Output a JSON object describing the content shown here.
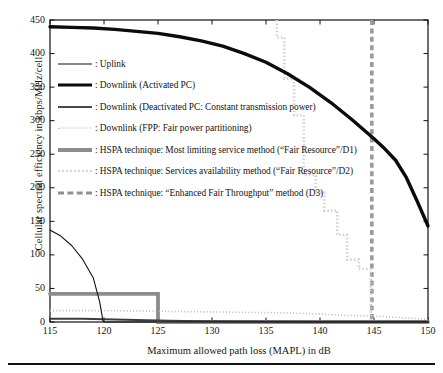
{
  "chart_data": {
    "type": "line",
    "title": "",
    "xlabel": "Maximum allowed path loss (MAPL) in dB",
    "ylabel": "Cellular spectral efficiency in kbps/MHz/cell",
    "xlim": [
      115,
      150
    ],
    "ylim": [
      0,
      450
    ],
    "xticks": [
      115,
      120,
      125,
      130,
      135,
      140,
      145,
      150
    ],
    "yticks": [
      0,
      50,
      100,
      150,
      200,
      250,
      300,
      350,
      400,
      450
    ],
    "grid": false,
    "legend_position": "upper-left-inside",
    "series": [
      {
        "name": "Uplink",
        "style": "thin-solid-black",
        "color": "#111111",
        "points": [
          [
            115,
            137
          ],
          [
            116,
            128
          ],
          [
            117,
            114
          ],
          [
            118,
            94
          ],
          [
            119,
            66
          ],
          [
            119.6,
            30
          ],
          [
            119.9,
            2
          ],
          [
            120,
            0
          ],
          [
            150,
            0
          ]
        ]
      },
      {
        "name": "Downlink (Activated PC)",
        "style": "thick-solid-black",
        "color": "#0b0b0b",
        "points": [
          [
            115,
            440
          ],
          [
            117,
            439
          ],
          [
            119,
            438
          ],
          [
            121,
            436
          ],
          [
            123,
            433
          ],
          [
            125,
            430
          ],
          [
            127,
            425
          ],
          [
            129,
            419
          ],
          [
            131,
            411
          ],
          [
            133,
            400
          ],
          [
            135,
            387
          ],
          [
            137,
            370
          ],
          [
            139,
            350
          ],
          [
            141,
            327
          ],
          [
            143,
            301
          ],
          [
            145,
            273
          ],
          [
            146,
            258
          ],
          [
            147,
            241
          ],
          [
            148,
            215
          ],
          [
            149,
            180
          ],
          [
            150,
            143
          ]
        ]
      },
      {
        "name": "Downlink (Deactivated PC: Constant transmission power)",
        "style": "medium-solid-gray",
        "color": "#3d3d3d",
        "points": [
          [
            115,
            5
          ],
          [
            118,
            5
          ],
          [
            120,
            4
          ],
          [
            123,
            3
          ],
          [
            126,
            2
          ],
          [
            129,
            1
          ],
          [
            133,
            0.6
          ],
          [
            140,
            0.3
          ],
          [
            150,
            0.2
          ]
        ]
      },
      {
        "name": "Downlink (FPP: Fair power partitioning)",
        "style": "dotted-light",
        "color": "#b9b9b9",
        "points": [
          [
            115,
            17
          ],
          [
            120,
            17
          ],
          [
            125,
            16
          ],
          [
            130,
            15
          ],
          [
            135,
            14
          ],
          [
            138,
            13
          ],
          [
            140,
            12
          ],
          [
            142,
            10
          ],
          [
            145,
            9
          ],
          [
            147,
            7
          ],
          [
            149,
            5
          ],
          [
            150,
            4
          ]
        ]
      },
      {
        "name": "HSPA technique: Most limiting service method (\"Fair Resource\"/D1)",
        "style": "thick-gray-step",
        "color": "#8c8c8c",
        "points": [
          [
            115,
            42
          ],
          [
            125,
            42
          ],
          [
            125,
            0
          ],
          [
            150,
            0
          ]
        ]
      },
      {
        "name": "HSPA technique: Services availability method (\"Fair Resource\"/D2)",
        "style": "dotted-staircase-light",
        "color": "#cfcfcf",
        "points": [
          [
            136,
            450
          ],
          [
            136,
            424
          ],
          [
            136.7,
            424
          ],
          [
            136.7,
            363
          ],
          [
            137.6,
            363
          ],
          [
            137.6,
            308
          ],
          [
            138.5,
            308
          ],
          [
            138.5,
            219
          ],
          [
            139.6,
            219
          ],
          [
            139.6,
            193
          ],
          [
            140.4,
            193
          ],
          [
            140.4,
            166
          ],
          [
            141.6,
            166
          ],
          [
            141.6,
            130
          ],
          [
            142.5,
            130
          ],
          [
            142.5,
            93
          ],
          [
            143.6,
            93
          ],
          [
            143.6,
            79
          ],
          [
            144.7,
            79
          ],
          [
            144.7,
            0
          ]
        ]
      },
      {
        "name": "HSPA technique: \"Enhanced Fair Throughput\" method (D3)",
        "style": "thick-dashed-gray-vertical",
        "color": "#9a9a9a",
        "points": [
          [
            144.8,
            450
          ],
          [
            144.8,
            0
          ]
        ]
      }
    ]
  },
  "axes": {
    "xlabel": "Maximum allowed path loss (MAPL) in dB",
    "ylabel": "Cellular spectral efficiency in kbps/MHz/cell",
    "xticklabels": [
      "115",
      "120",
      "125",
      "130",
      "135",
      "140",
      "145",
      "150"
    ],
    "yticklabels": [
      "0",
      "50",
      "100",
      "150",
      "200",
      "250",
      "300",
      "350",
      "400",
      "450"
    ]
  },
  "legend": {
    "items": [
      {
        "swatch": "sw-thin",
        "label": ": Uplink"
      },
      {
        "swatch": "sw-thick",
        "label": ": Downlink (Activated PC)"
      },
      {
        "swatch": "sw-med",
        "label": ": Downlink (Deactivated PC: Constant transmission power)"
      },
      {
        "swatch": "sw-dot",
        "label": ": Downlink (FPP: Fair power partitioning)"
      },
      {
        "swatch": "sw-graythick",
        "label": ": HSPA technique: Most limiting service method (“Fair Resource”/D1)"
      },
      {
        "swatch": "sw-dotlight",
        "label": ": HSPA technique: Services availability method (“Fair Resource”/D2)"
      },
      {
        "swatch": "sw-dash",
        "label": ": HSPA technique: “Enhanced Fair Throughput” method (D3)"
      }
    ]
  },
  "colors": {
    "axis": "#111111",
    "uplink": "#111111",
    "downlink_pc": "#0b0b0b",
    "downlink_const": "#3d3d3d",
    "fpp": "#b9b9b9",
    "d1": "#8c8c8c",
    "d2": "#cfcfcf",
    "d3": "#9a9a9a",
    "background": "#ffffff"
  }
}
